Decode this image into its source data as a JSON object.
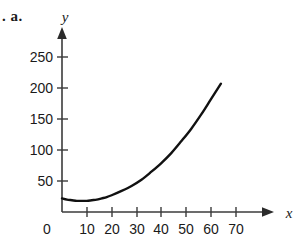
{
  "figure": {
    "item_label": ". a.",
    "background_color": "#ffffff",
    "curve_color": "#111111",
    "axis_color": "#3b3b3b"
  },
  "chart_data": {
    "type": "line",
    "title": "",
    "xlabel": "x",
    "ylabel": "y",
    "xlim": [
      0,
      75
    ],
    "ylim": [
      0,
      270
    ],
    "x_ticks": [
      0,
      10,
      20,
      30,
      40,
      50,
      60,
      70
    ],
    "x_tick_labels": [
      "0",
      "10",
      "20",
      "30",
      "40",
      "50",
      "60",
      "70"
    ],
    "y_ticks": [
      50,
      100,
      150,
      200,
      250
    ],
    "y_tick_labels": [
      "50",
      "100",
      "150",
      "200",
      "250"
    ],
    "grid": false,
    "legend": null,
    "annotations": [],
    "series": [
      {
        "name": "curve",
        "description": "upward-opening parabola with vertex near (8, 18)",
        "x": [
          0,
          2,
          4,
          6,
          8,
          10,
          12,
          14,
          16,
          18,
          20,
          24,
          28,
          32,
          36,
          40,
          44,
          48,
          52,
          56,
          60,
          64
        ],
        "y": [
          22,
          20,
          19,
          18,
          18,
          18,
          19,
          20,
          22,
          24,
          27,
          34,
          42,
          52,
          65,
          79,
          95,
          114,
          134,
          157,
          182,
          207
        ]
      }
    ]
  }
}
